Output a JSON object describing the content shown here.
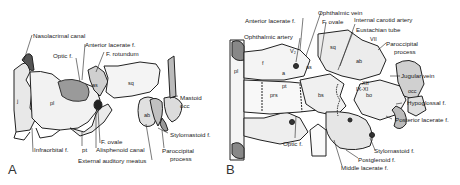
{
  "figure": {
    "panels": [
      {
        "id": "A",
        "label": "A",
        "annotations": {
          "nasolacrimal_canal": "Nasolacrimal canal",
          "optic_f": "Optic f.",
          "anterior_lacerate_f": "Anterior lacerate f.",
          "f_rotundum": "F. rotundum",
          "mastoid": "Mastoid",
          "occ": "occ",
          "stylomastoid_f": "Stylomastoid f.",
          "paroccipital_process_1": "Paroccipital",
          "paroccipital_process_2": "process",
          "external_auditory_meatus": "External auditory meatus",
          "alisphenoid_canal": "Alisphenoid canal",
          "f_ovale": "F. ovale",
          "pt": "pt",
          "infraorbital_f": "Infraorbital f."
        },
        "bone_labels": {
          "pl": "pl",
          "as": "as",
          "sq": "sq",
          "ab": "ab",
          "j": "j"
        }
      },
      {
        "id": "B",
        "label": "B",
        "annotations": {
          "anterior_lacerate_f": "Anterior lacerate f.",
          "ophthalmic_vein": "Ophthalmic vein",
          "f_ovale": "F. ovale",
          "internal_carotid_artery": "Internal carotid artery",
          "eustachian_tube": "Eustachian tube",
          "ophthalmic_artery": "Ophthalmic artery",
          "paroccipital_process_1": "Paroccipital",
          "paroccipital_process_2": "process",
          "jugular_vein": "Jugular vein",
          "hypoglossal_f": "Hypoglossal f.",
          "posterior_lacerate_f": "Posterior lacerate f.",
          "optic_f": "Optic f.",
          "stylomastoid_f": "Stylomastoid f.",
          "postglenoid_f": "Postglenoid f.",
          "middle_lacerate_f": "Middle lacerate f."
        },
        "bone_labels": {
          "f": "f",
          "pl": "pl",
          "a": "a",
          "as": "as",
          "sq": "sq",
          "ab": "ab",
          "bs": "bs",
          "bo": "bo",
          "prs": "prs",
          "pt": "pt",
          "occ": "occ",
          "v2": "V₂",
          "xii": "XII",
          "ix_xi": "IX-XI",
          "vii": "VII"
        }
      }
    ]
  }
}
